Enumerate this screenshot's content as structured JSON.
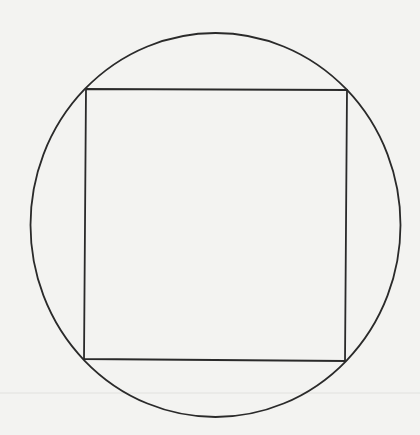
{
  "diagram": {
    "background": "#f3f3f1",
    "stroke_color": "#2a2a2a",
    "circle": {
      "cx": 215.5,
      "cy": 225,
      "rx": 185,
      "ry": 192,
      "stroke_width": 1.8
    },
    "square": {
      "points": [
        [
          86,
          89
        ],
        [
          347,
          90
        ],
        [
          345,
          361
        ],
        [
          84,
          359
        ]
      ],
      "stroke_width": 1.8
    },
    "scan_line": {
      "y": 393,
      "color": "#dcdcda"
    }
  }
}
